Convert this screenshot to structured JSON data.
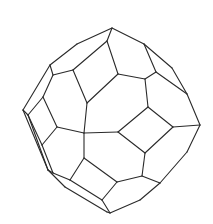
{
  "figure": {
    "stroke_color": "#2a2a2a",
    "background": "#ffffff",
    "edges": [
      [
        112,
        28,
        144,
        44
      ],
      [
        144,
        44,
        172,
        68
      ],
      [
        172,
        68,
        187,
        94
      ],
      [
        187,
        94,
        200,
        125
      ],
      [
        200,
        125,
        187,
        152
      ],
      [
        187,
        152,
        160,
        183
      ],
      [
        160,
        183,
        140,
        200
      ],
      [
        140,
        200,
        110,
        213
      ],
      [
        110,
        213,
        107,
        212
      ],
      [
        107,
        212,
        65,
        187
      ],
      [
        65,
        187,
        48,
        170
      ],
      [
        48,
        170,
        28,
        115
      ],
      [
        28,
        115,
        23,
        110
      ],
      [
        23,
        110,
        50,
        65
      ],
      [
        50,
        65,
        77,
        44
      ],
      [
        77,
        44,
        112,
        28
      ],
      [
        112,
        28,
        107,
        41
      ],
      [
        107,
        41,
        73,
        70
      ],
      [
        73,
        70,
        53,
        75
      ],
      [
        53,
        75,
        50,
        65
      ],
      [
        107,
        41,
        118,
        74
      ],
      [
        118,
        74,
        145,
        79
      ],
      [
        145,
        79,
        156,
        72
      ],
      [
        156,
        72,
        144,
        44
      ],
      [
        156,
        72,
        187,
        94
      ],
      [
        145,
        79,
        148,
        107
      ],
      [
        148,
        107,
        173,
        127
      ],
      [
        173,
        127,
        200,
        125
      ],
      [
        148,
        107,
        118,
        132
      ],
      [
        118,
        74,
        87,
        103
      ],
      [
        87,
        103,
        73,
        70
      ],
      [
        87,
        103,
        84,
        133
      ],
      [
        84,
        133,
        118,
        132
      ],
      [
        118,
        132,
        145,
        153
      ],
      [
        145,
        153,
        173,
        127
      ],
      [
        145,
        153,
        142,
        176
      ],
      [
        142,
        176,
        160,
        183
      ],
      [
        142,
        176,
        117,
        182
      ],
      [
        117,
        182,
        102,
        200
      ],
      [
        102,
        200,
        110,
        213
      ],
      [
        117,
        182,
        84,
        158
      ],
      [
        84,
        158,
        84,
        133
      ],
      [
        84,
        158,
        70,
        180
      ],
      [
        70,
        180,
        53,
        173
      ],
      [
        53,
        173,
        48,
        170
      ],
      [
        70,
        180,
        102,
        200
      ],
      [
        84,
        133,
        57,
        127
      ],
      [
        57,
        127,
        43,
        97
      ],
      [
        43,
        97,
        53,
        75
      ],
      [
        57,
        127,
        42,
        145
      ],
      [
        42,
        145,
        53,
        173
      ],
      [
        43,
        97,
        28,
        115
      ],
      [
        28,
        115,
        42,
        145
      ],
      [
        23,
        110,
        48,
        170
      ]
    ]
  }
}
